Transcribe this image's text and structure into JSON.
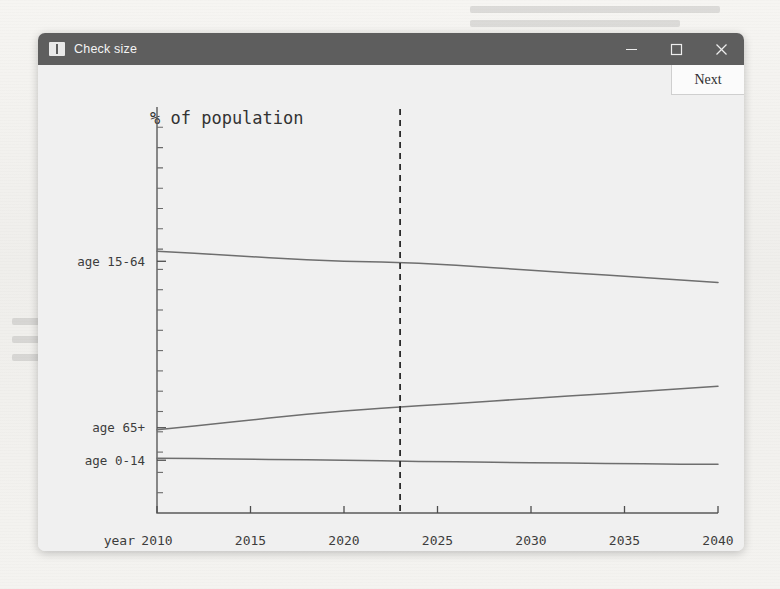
{
  "window": {
    "title": "Check size",
    "icon": "window-app-icon",
    "controls": {
      "minimize": "minimize-icon",
      "maximize": "maximize-icon",
      "close": "close-icon"
    }
  },
  "toolbar": {
    "next_label": "Next"
  },
  "colors": {
    "titlebar": "#5e5e5e",
    "window_bg": "#f0f0f0",
    "line": "#6e6e6e",
    "axis": "#5a5a5a",
    "marker": "#2b2b2b"
  },
  "chart_data": {
    "type": "line",
    "title": "% of population",
    "xlabel": "year",
    "ylabel": "",
    "grid": false,
    "legend": "inline-left-labels",
    "xlim": [
      2010,
      2040
    ],
    "xticks": [
      2010,
      2015,
      2020,
      2025,
      2030,
      2035,
      2040
    ],
    "xtick_labels": [
      "2010",
      "2015",
      "2020",
      "2025",
      "2030",
      "2035",
      "2040"
    ],
    "ylim": [
      0,
      100
    ],
    "ytick_labels": [
      "age 15-64",
      "age 65+",
      "age 0-14"
    ],
    "annotations": [
      {
        "type": "vline",
        "x": 2023,
        "style": "dashed",
        "label": ""
      }
    ],
    "x": [
      2010,
      2012,
      2014,
      2016,
      2018,
      2020,
      2022,
      2024,
      2026,
      2028,
      2030,
      2032,
      2034,
      2036,
      2038,
      2040
    ],
    "series": [
      {
        "name": "age 15-64",
        "label_y": 62,
        "values": [
          64.5,
          64.0,
          63.4,
          62.9,
          62.4,
          62.0,
          61.8,
          61.5,
          61.0,
          60.4,
          59.8,
          59.2,
          58.6,
          58.0,
          57.4,
          56.8
        ]
      },
      {
        "name": "age 65+",
        "label_y": 21,
        "values": [
          20.5,
          21.4,
          22.4,
          23.4,
          24.3,
          25.1,
          25.8,
          26.4,
          27.0,
          27.6,
          28.2,
          28.8,
          29.4,
          30.0,
          30.6,
          31.2
        ]
      },
      {
        "name": "age 0-14",
        "label_y": 13,
        "values": [
          13.5,
          13.4,
          13.3,
          13.2,
          13.1,
          13.0,
          12.9,
          12.7,
          12.6,
          12.5,
          12.4,
          12.3,
          12.2,
          12.1,
          12.0,
          12.0
        ]
      }
    ]
  }
}
